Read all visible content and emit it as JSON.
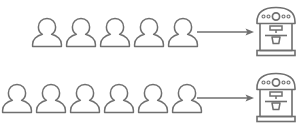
{
  "diagram": {
    "stroke_color": "#6f6f6f",
    "background_color": "#ffffff",
    "rows": [
      {
        "id": "row-top",
        "label": "Top queue",
        "person_count": 5,
        "person_icon": "person-icon",
        "arrow_icon": "arrow-right-icon",
        "arrow_label": "serves",
        "machine_icon": "espresso-machine-icon",
        "machine_label": "Espresso machine"
      },
      {
        "id": "row-bottom",
        "label": "Bottom queue",
        "person_count": 6,
        "person_icon": "person-icon",
        "arrow_icon": "arrow-right-icon",
        "arrow_label": "serves",
        "machine_icon": "espresso-machine-icon",
        "machine_label": "Espresso machine"
      }
    ],
    "machine": {
      "panel_small_dots": 4,
      "panel_large_dial": 1,
      "cup_count": 1
    }
  }
}
